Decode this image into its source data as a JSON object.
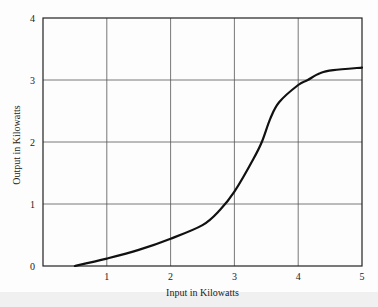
{
  "chart_data": {
    "type": "line",
    "title": "",
    "xlabel": "Input in Kilowatts",
    "ylabel": "Output in Kilowatts",
    "xlim": [
      0,
      5
    ],
    "ylim": [
      0,
      4
    ],
    "grid": true,
    "x_ticks": [
      {
        "value": 1,
        "label": "1"
      },
      {
        "value": 2,
        "label": "2"
      },
      {
        "value": 3,
        "label": "3"
      },
      {
        "value": 4,
        "label": "4"
      },
      {
        "value": 5,
        "label": "5"
      }
    ],
    "y_ticks": [
      {
        "value": 0,
        "label": "0"
      },
      {
        "value": 1,
        "label": "1"
      },
      {
        "value": 2,
        "label": "2"
      },
      {
        "value": 3,
        "label": "3"
      },
      {
        "value": 4,
        "label": "4"
      }
    ],
    "series": [
      {
        "name": "Output vs Input",
        "color": "#111111",
        "x": [
          0.5,
          1.0,
          1.5,
          2.0,
          2.5,
          2.77,
          3.0,
          3.3,
          3.43,
          3.56,
          3.7,
          4.0,
          4.15,
          4.34,
          4.55,
          5.0
        ],
        "y": [
          0.0,
          0.12,
          0.26,
          0.44,
          0.66,
          0.9,
          1.2,
          1.73,
          2.0,
          2.37,
          2.64,
          2.92,
          3.0,
          3.11,
          3.16,
          3.2
        ]
      }
    ]
  }
}
